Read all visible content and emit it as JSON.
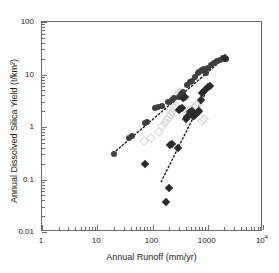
{
  "figure": {
    "background_color": "#ffffff",
    "frame_color": "#6b6b6b"
  },
  "chart_data": {
    "type": "scatter",
    "title": "",
    "xlabel": "Annual Runoff (mm/yr)",
    "ylabel": "Annual Dissolved Silica Yield (t/km²)",
    "xscale": "log",
    "yscale": "log",
    "xlim": [
      1,
      10000
    ],
    "ylim": [
      0.01,
      100
    ],
    "grid": false,
    "legend": "none",
    "xticks": [
      {
        "value": 1,
        "label": "1"
      },
      {
        "value": 10,
        "label": "10"
      },
      {
        "value": 100,
        "label": "100"
      },
      {
        "value": 1000,
        "label": "1000"
      },
      {
        "value": 10000,
        "label": "10",
        "exponent": "4"
      }
    ],
    "yticks": [
      {
        "value": 0.01,
        "label": "0.01"
      },
      {
        "value": 0.1,
        "label": "0.1"
      },
      {
        "value": 1,
        "label": "1"
      },
      {
        "value": 10,
        "label": "10"
      },
      {
        "value": 100,
        "label": "100"
      }
    ],
    "series": [
      {
        "name": "filled-circles",
        "marker": "circle",
        "color": "#3f3f3f",
        "filled": true,
        "size": 6,
        "points": [
          [
            20,
            0.3
          ],
          [
            38,
            0.62
          ],
          [
            43,
            0.66
          ],
          [
            72,
            1.2
          ],
          [
            78,
            1.25
          ],
          [
            110,
            2.3
          ],
          [
            128,
            2.45
          ],
          [
            150,
            2.55
          ],
          [
            190,
            2.95
          ],
          [
            230,
            3.3
          ],
          [
            250,
            3.55
          ],
          [
            300,
            3.7
          ],
          [
            330,
            4.2
          ],
          [
            360,
            4.6
          ],
          [
            430,
            6.2
          ],
          [
            470,
            7.3
          ],
          [
            520,
            7.6
          ],
          [
            600,
            9.0
          ],
          [
            660,
            10.5
          ],
          [
            700,
            11.0
          ],
          [
            760,
            11.5
          ],
          [
            800,
            12.0
          ],
          [
            870,
            12.5
          ],
          [
            930,
            10.8
          ],
          [
            1000,
            13.5
          ],
          [
            1150,
            15.0
          ],
          [
            1300,
            16.5
          ],
          [
            1500,
            18.0
          ],
          [
            1700,
            19.0
          ],
          [
            1850,
            20.5
          ],
          [
            2000,
            19.5
          ],
          [
            2100,
            20.0
          ]
        ]
      },
      {
        "name": "filled-diamonds",
        "marker": "diamond",
        "color": "#2b2b2b",
        "filled": true,
        "size": 6,
        "points": [
          [
            72,
            0.195
          ],
          [
            175,
            0.037
          ],
          [
            200,
            0.07
          ],
          [
            210,
            0.455
          ],
          [
            230,
            0.47
          ],
          [
            290,
            0.39
          ],
          [
            300,
            2.1
          ],
          [
            320,
            2.25
          ],
          [
            340,
            2.3
          ],
          [
            360,
            3.6
          ],
          [
            380,
            3.7
          ],
          [
            400,
            1.45
          ],
          [
            430,
            1.55
          ],
          [
            480,
            1.9
          ],
          [
            520,
            2.0
          ],
          [
            540,
            1.6
          ],
          [
            560,
            1.65
          ],
          [
            600,
            1.75
          ],
          [
            620,
            1.8
          ],
          [
            660,
            1.95
          ],
          [
            700,
            2.05
          ],
          [
            740,
            3.3
          ],
          [
            800,
            4.4
          ],
          [
            900,
            5.0
          ],
          [
            1000,
            5.7
          ],
          [
            1100,
            6.0
          ],
          [
            2050,
            21.0
          ]
        ]
      },
      {
        "name": "open-diamonds-faint",
        "marker": "diamond",
        "color": "#d8d8d8",
        "filled": false,
        "size": 7,
        "points": [
          [
            70,
            0.55
          ],
          [
            95,
            0.62
          ],
          [
            130,
            0.8
          ],
          [
            150,
            1.05
          ],
          [
            170,
            1.2
          ],
          [
            185,
            1.35
          ],
          [
            200,
            1.55
          ],
          [
            215,
            1.7
          ],
          [
            230,
            1.95
          ],
          [
            250,
            2.3
          ],
          [
            270,
            2.55
          ],
          [
            300,
            4.4
          ],
          [
            330,
            4.6
          ],
          [
            420,
            1.8
          ],
          [
            470,
            2.15
          ],
          [
            560,
            2.4
          ],
          [
            620,
            2.55
          ],
          [
            700,
            2.8
          ],
          [
            780,
            1.3
          ],
          [
            860,
            1.4
          ]
        ]
      }
    ],
    "trendlines": [
      {
        "name": "upper-trend",
        "style": "dashed",
        "color": "#1a1a1a",
        "start": [
          20,
          0.3
        ],
        "end": [
          2100,
          20.0
        ]
      },
      {
        "name": "lower-trend",
        "style": "dashed",
        "color": "#1a1a1a",
        "start": [
          150,
          0.085
        ],
        "end": [
          1150,
          6.1
        ]
      }
    ]
  }
}
